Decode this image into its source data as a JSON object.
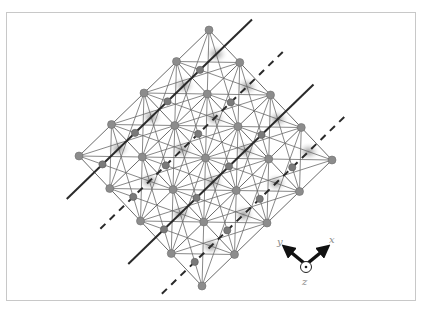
{
  "figure": {
    "type": "crystal-lattice-diagram",
    "grid": {
      "rows": 4,
      "cols": 4
    },
    "origin_node": [
      209,
      30
    ],
    "step_u": [
      30.75,
      32.5
    ],
    "step_v": [
      -32.5,
      31.5
    ],
    "colors": {
      "frame": "#c8c8c8",
      "lattice_line": "#6a6a6a",
      "main_node": "#8c8c8c",
      "small_node": "#7a7a7a",
      "blur_spot": "#9a9a9a",
      "plane_line": "#2a2a2a",
      "axis_arrow": "#111111"
    },
    "plane_lines": [
      {
        "a": 0.5,
        "style": "solid"
      },
      {
        "a": 1.5,
        "style": "dashed"
      },
      {
        "a": 2.5,
        "style": "solid"
      },
      {
        "a": 3.5,
        "style": "dashed"
      }
    ]
  },
  "axes": {
    "x_label": "x",
    "y_label": "y",
    "z_label": "z",
    "z_symbol": "out-of-plane (dot in circle)"
  }
}
